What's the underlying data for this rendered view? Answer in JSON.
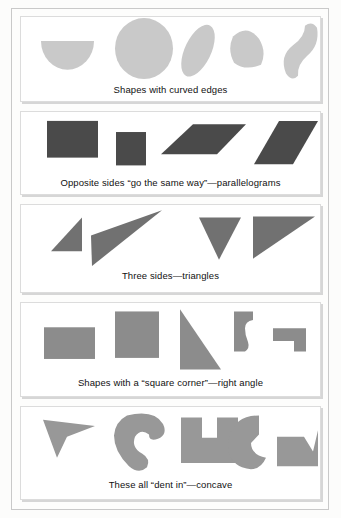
{
  "page": {
    "background_color": "#fcfcfb",
    "frame_color": "#c9c9c9"
  },
  "panels": [
    {
      "id": "curved",
      "caption": "Shapes with curved edges",
      "fill_color": "#c9c9c9",
      "shape_names": [
        "half-disc",
        "circle",
        "ellipse-tilted",
        "rounded-wedge",
        "crescent-bean"
      ],
      "shape_count": 5
    },
    {
      "id": "parallelogram",
      "caption": "Opposite sides “go the same way”—parallelograms",
      "fill_color": "#4a4a4a",
      "shape_names": [
        "rectangle-wide",
        "square",
        "parallelogram-flat",
        "parallelogram-slanted"
      ],
      "shape_count": 4
    },
    {
      "id": "triangles",
      "caption": "Three sides—triangles",
      "fill_color": "#717171",
      "shape_names": [
        "right-triangle-small",
        "sliver-triangle",
        "inverted-triangle",
        "right-triangle-large"
      ],
      "shape_count": 4
    },
    {
      "id": "right-angle",
      "caption": "Shapes with a “square corner”—right angle",
      "fill_color": "#8c8c8c",
      "shape_names": [
        "rectangle-wide",
        "square",
        "right-triangle-tall",
        "curved-hook-polygon",
        "step-corner-polygon"
      ],
      "shape_count": 5
    },
    {
      "id": "concave",
      "caption": "These all “dent in”—concave",
      "fill_color": "#989898",
      "shape_names": [
        "arrowhead-dart",
        "thick-crescent",
        "u-notch-block",
        "pac-wedge",
        "chevron-notch-block"
      ],
      "shape_count": 5
    }
  ]
}
